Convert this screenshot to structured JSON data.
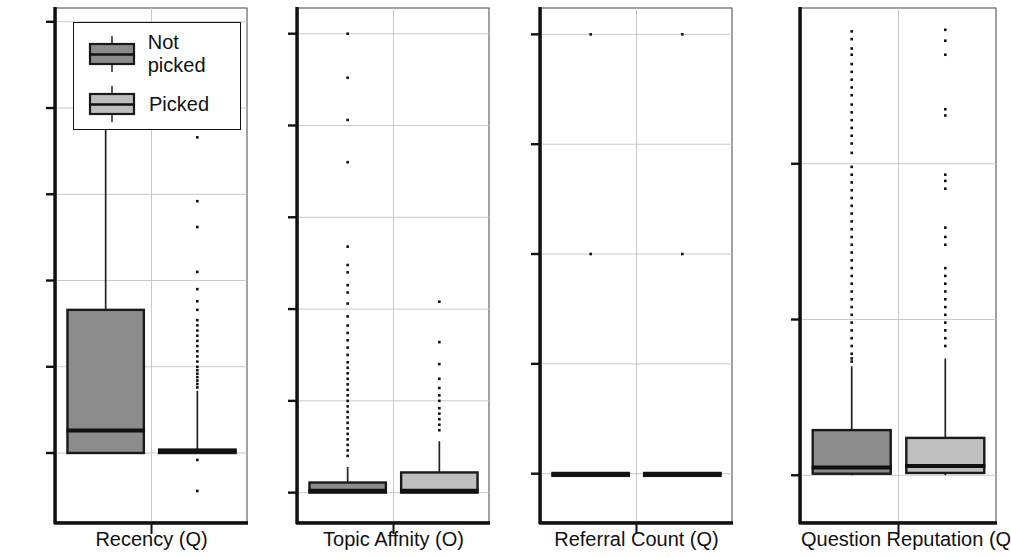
{
  "figure": {
    "type": "boxplot-grid",
    "panel_count": 4,
    "legend": {
      "entries": [
        {
          "label": "Not picked",
          "fill": "#8c8c8c",
          "group": "not_picked"
        },
        {
          "label": "Picked",
          "fill": "#bdbdbd",
          "group": "picked"
        }
      ]
    }
  },
  "chart_data": [
    {
      "type": "box",
      "title": "",
      "xlabel": "Recency (Q)",
      "ylabel": "",
      "ylim": [
        -40,
        258
      ],
      "yticks": [
        0,
        50,
        100,
        150,
        200,
        250
      ],
      "ytick_labels": [
        "0",
        "50",
        "100",
        "150",
        "200",
        "250"
      ],
      "grid": true,
      "legend_position": "top-left",
      "categories": [
        "Not picked",
        "Picked"
      ],
      "series": [
        {
          "name": "Not picked",
          "q1": 0,
          "median": 13,
          "q3": 83,
          "whisker_low": 0,
          "whisker_high": 207,
          "outliers": []
        },
        {
          "name": "Picked",
          "q1": 0,
          "median": 1,
          "q3": 2,
          "whisker_low": 0,
          "whisker_high": 36,
          "outliers": [
            183,
            146,
            131,
            105,
            95,
            88,
            83,
            77,
            74,
            71,
            68,
            65,
            62,
            59,
            56,
            53,
            50,
            48,
            46,
            44,
            42,
            40,
            38,
            -4,
            -22
          ]
        }
      ]
    },
    {
      "type": "box",
      "title": "",
      "xlabel": "Topic Affnity (O)",
      "ylabel": "",
      "ylim": [
        -1.6,
        26.4
      ],
      "yticks": [
        0,
        5,
        10,
        15,
        20,
        25
      ],
      "ytick_labels": [
        "0",
        "5",
        "10",
        "15",
        "20",
        "25"
      ],
      "grid": true,
      "categories": [
        "Not picked",
        "Picked"
      ],
      "series": [
        {
          "name": "Not picked",
          "q1": 0,
          "median": 0.1,
          "q3": 0.55,
          "whisker_low": 0,
          "whisker_high": 1.4,
          "outliers": [
            25.0,
            22.6,
            20.3,
            18.0,
            13.4,
            12.4,
            12.0,
            11.3,
            10.9,
            10.3,
            9.6,
            9.1,
            8.7,
            8.3,
            7.9,
            7.5,
            7.1,
            6.8,
            6.5,
            6.2,
            5.9,
            5.6,
            5.3,
            5.0,
            4.7,
            4.4,
            4.1,
            3.8,
            3.5,
            3.2,
            2.9,
            2.6,
            2.3,
            2.0
          ]
        },
        {
          "name": "Picked",
          "q1": 0,
          "median": 0.1,
          "q3": 1.1,
          "whisker_low": 0,
          "whisker_high": 2.8,
          "outliers": [
            10.4,
            8.2,
            7.0,
            6.2,
            5.7,
            5.3,
            5.0,
            4.6,
            4.3,
            4.0,
            3.7,
            3.4
          ]
        }
      ]
    },
    {
      "type": "box",
      "title": "",
      "xlabel": "Referral Count (Q)",
      "ylabel": "",
      "ylim": [
        -0.22,
        2.12
      ],
      "yticks": [
        0.0,
        0.5,
        1.0,
        1.5,
        2.0
      ],
      "ytick_labels": [
        "0.0",
        "0.5",
        "1.0",
        "1.5",
        "2.0"
      ],
      "grid": true,
      "categories": [
        "Not picked",
        "Picked"
      ],
      "series": [
        {
          "name": "Not picked",
          "q1": 0,
          "median": 0,
          "q3": 0,
          "whisker_low": 0,
          "whisker_high": 0,
          "outliers": [
            2.0,
            1.0
          ]
        },
        {
          "name": "Picked",
          "q1": 0,
          "median": 0,
          "q3": 0,
          "whisker_low": 0,
          "whisker_high": 0,
          "outliers": [
            2.0,
            1.0
          ]
        }
      ]
    },
    {
      "type": "box",
      "title": "",
      "xlabel": "Question Reputation (Q)",
      "ylabel": "",
      "ylim": [
        -60,
        600
      ],
      "yticks": [
        0,
        200,
        400
      ],
      "ytick_labels": [
        "0",
        "200",
        "400"
      ],
      "grid": true,
      "categories": [
        "Not picked",
        "Picked"
      ],
      "series": [
        {
          "name": "Not picked",
          "q1": 2,
          "median": 10,
          "q3": 58,
          "whisker_low": 0,
          "whisker_high": 140,
          "outliers": [
            570,
            560,
            548,
            540,
            528,
            518,
            508,
            498,
            488,
            476,
            466,
            456,
            446,
            436,
            426,
            414,
            396,
            386,
            376,
            366,
            356,
            346,
            336,
            326,
            316,
            306,
            296,
            286,
            276,
            266,
            256,
            246,
            236,
            226,
            216,
            206,
            196,
            186,
            176,
            166,
            156,
            150,
            146
          ]
        },
        {
          "name": "Picked",
          "q1": 3,
          "median": 12,
          "q3": 48,
          "whisker_low": 0,
          "whisker_high": 150,
          "outliers": [
            572,
            558,
            540,
            470,
            462,
            386,
            378,
            368,
            318,
            306,
            296,
            266,
            256,
            246,
            236,
            226,
            216,
            206,
            196,
            186,
            176,
            166
          ]
        }
      ]
    }
  ]
}
